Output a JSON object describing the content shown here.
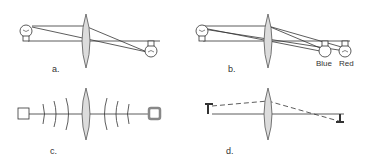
{
  "diagram": {
    "panels": [
      {
        "id": "a",
        "label": "a.",
        "description": "Point source bulb imaged by converging lens to inverted image bulb"
      },
      {
        "id": "b",
        "label": "b.",
        "description": "Chromatic aberration: different focal points for colors",
        "image_labels": [
          "Blue",
          "Red"
        ]
      },
      {
        "id": "c",
        "label": "c.",
        "description": "Wavefronts from square source through lens to square image"
      },
      {
        "id": "d",
        "label": "d.",
        "description": "Object T imaged as inverted T through lens with dashed ray"
      }
    ],
    "colors": {
      "line": "#333333",
      "lens_fill": "#dcdcdc",
      "lens_stroke": "#555555",
      "image_square_stroke": "#888888"
    }
  }
}
